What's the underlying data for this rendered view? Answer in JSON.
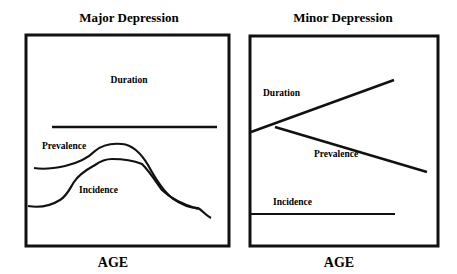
{
  "panels": [
    {
      "title": "Major Depression",
      "x_axis_label": "AGE",
      "curves": [
        {
          "label": "Duration",
          "shape": "flat horizontal line"
        },
        {
          "label": "Prevalence",
          "shape": "rises, peaks mid-age, declines"
        },
        {
          "label": "Incidence",
          "shape": "low start, peaks mid-age, declines, converges with prevalence"
        }
      ]
    },
    {
      "title": "Minor Depression",
      "x_axis_label": "AGE",
      "curves": [
        {
          "label": "Duration",
          "shape": "increasing straight line"
        },
        {
          "label": "Prevalence",
          "shape": "decreasing straight line"
        },
        {
          "label": "Incidence",
          "shape": "flat horizontal line"
        }
      ]
    }
  ],
  "colors": {
    "line": "#111111",
    "background": "#ffffff"
  }
}
